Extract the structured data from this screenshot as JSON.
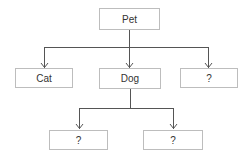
{
  "diagram": {
    "type": "tree",
    "colors": {
      "line": "#555555",
      "border": "#bdbdbd",
      "text": "#333333"
    },
    "nodes": {
      "root": {
        "label": "Pet"
      },
      "cat": {
        "label": "Cat"
      },
      "dog": {
        "label": "Dog"
      },
      "unknown_1": {
        "label": "?"
      },
      "dog_child_1": {
        "label": "?"
      },
      "dog_child_2": {
        "label": "?"
      }
    },
    "edges": [
      {
        "from": "Pet",
        "to": "Cat"
      },
      {
        "from": "Pet",
        "to": "Dog"
      },
      {
        "from": "Pet",
        "to": "?"
      },
      {
        "from": "Dog",
        "to": "?"
      },
      {
        "from": "Dog",
        "to": "?"
      }
    ]
  }
}
